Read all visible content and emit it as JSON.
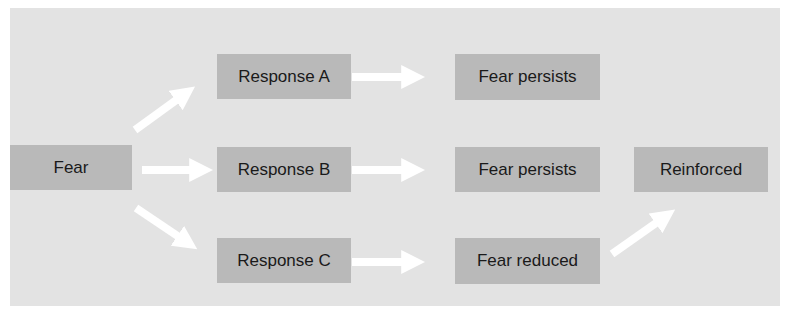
{
  "diagram": {
    "type": "flowchart",
    "colors": {
      "panel_background": "#e3e3e3",
      "node_fill": "#b9b9b9",
      "arrow": "#ffffff",
      "text": "#1a1a1a"
    },
    "nodes": [
      {
        "id": "fear",
        "label": "Fear"
      },
      {
        "id": "response_a",
        "label": "Response A"
      },
      {
        "id": "response_b",
        "label": "Response B"
      },
      {
        "id": "response_c",
        "label": "Response C"
      },
      {
        "id": "fear_persists_a",
        "label": "Fear persists"
      },
      {
        "id": "fear_persists_b",
        "label": "Fear persists"
      },
      {
        "id": "fear_reduced",
        "label": "Fear reduced"
      },
      {
        "id": "reinforced",
        "label": "Reinforced"
      }
    ],
    "edges": [
      {
        "from": "fear",
        "to": "response_a"
      },
      {
        "from": "fear",
        "to": "response_b"
      },
      {
        "from": "fear",
        "to": "response_c"
      },
      {
        "from": "response_a",
        "to": "fear_persists_a"
      },
      {
        "from": "response_b",
        "to": "fear_persists_b"
      },
      {
        "from": "response_c",
        "to": "fear_reduced"
      },
      {
        "from": "fear_reduced",
        "to": "reinforced"
      }
    ]
  }
}
